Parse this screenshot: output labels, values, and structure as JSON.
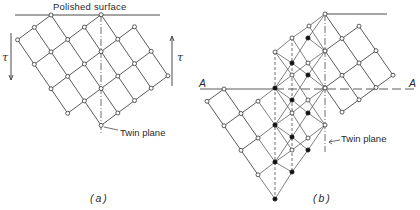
{
  "figure": {
    "panel_a": {
      "caption": "(a)",
      "surface_label": "Polished surface",
      "twin_label": "Twin plane",
      "shear_label_left": "τ",
      "shear_label_right": "τ"
    },
    "panel_b": {
      "caption": "(b)",
      "twin_label": "Twin plane",
      "plane_label_left": "A",
      "plane_label_right": "A"
    },
    "colors": {
      "line": "#4a4a4a",
      "node_open": "#ffffff",
      "node_filled": "#111111",
      "background": "#ffffff"
    }
  },
  "geometry": {
    "a": {
      "origin": [
        51,
        15
      ],
      "u": [
        16.7,
        -12.4
      ],
      "v": [
        16.7,
        24.5
      ],
      "nodes": [
        [
          -2,
          0
        ],
        [
          -1,
          0
        ],
        [
          0,
          0
        ],
        [
          -2,
          1
        ],
        [
          -1,
          1
        ],
        [
          0,
          1
        ],
        [
          1,
          1
        ],
        [
          2,
          1
        ],
        [
          -2,
          2
        ],
        [
          -1,
          2
        ],
        [
          0,
          2
        ],
        [
          1,
          2
        ],
        [
          2,
          2
        ],
        [
          3,
          2
        ],
        [
          -2,
          3
        ],
        [
          -1,
          3
        ],
        [
          0,
          3
        ],
        [
          1,
          3
        ],
        [
          2,
          3
        ],
        [
          3,
          3
        ],
        [
          -1,
          4
        ],
        [
          0,
          4
        ],
        [
          1,
          4
        ],
        [
          2,
          4
        ],
        [
          3,
          4
        ]
      ],
      "surface_line": [
        15,
        15,
        160,
        15
      ],
      "twin_line": [
        101,
        15,
        101,
        133
      ],
      "tau_left": [
        11,
        33,
        11,
        80
      ],
      "tau_right": [
        172,
        86,
        172,
        36
      ]
    },
    "b": {
      "right_origin": [
        325,
        14
      ],
      "u": [
        17,
        -12.3
      ],
      "v": [
        17,
        24.5
      ],
      "right_nodes": [
        [
          0,
          0
        ],
        [
          1,
          1
        ],
        [
          0,
          1
        ],
        [
          -1,
          1
        ],
        [
          1,
          2
        ],
        [
          0,
          2
        ],
        [
          -1,
          2
        ],
        [
          -2,
          2
        ],
        [
          1,
          3
        ],
        [
          0,
          3
        ],
        [
          -1,
          3
        ],
        [
          -2,
          3
        ]
      ],
      "left_origin": [
        224,
        89
      ],
      "left_nodes": [
        [
          0,
          0
        ],
        [
          -1,
          0
        ],
        [
          0,
          1
        ],
        [
          1,
          1
        ],
        [
          -1,
          1
        ],
        [
          0,
          2
        ],
        [
          -1,
          2
        ],
        [
          -1,
          3
        ]
      ],
      "twin_open": [
        [
          309,
          26
        ],
        [
          292,
          38
        ],
        [
          275,
          52
        ],
        [
          308,
          63
        ],
        [
          292,
          75
        ],
        [
          325,
          51
        ],
        [
          308,
          100
        ],
        [
          292,
          113
        ],
        [
          325,
          88
        ],
        [
          308,
          138
        ],
        [
          292,
          150
        ],
        [
          325,
          125
        ]
      ],
      "twin_filled": [
        [
          308,
          38
        ],
        [
          292,
          63
        ],
        [
          308,
          75
        ],
        [
          275,
          88
        ],
        [
          292,
          100
        ],
        [
          308,
          113
        ],
        [
          275,
          125
        ],
        [
          292,
          137
        ],
        [
          308,
          150
        ],
        [
          275,
          162
        ],
        [
          292,
          172
        ],
        [
          275,
          199
        ]
      ],
      "surface_line": [
        325,
        14,
        387,
        14
      ],
      "a_line": [
        200,
        89,
        415,
        89
      ],
      "twin_line": [
        325,
        14,
        325,
        152
      ],
      "dashed_verticals": [
        [
          275,
          52,
          275,
          199
        ],
        [
          292,
          38,
          292,
          172
        ]
      ]
    }
  }
}
